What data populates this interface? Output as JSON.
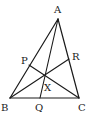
{
  "diagram": {
    "type": "triangle-cevians",
    "vertices": [
      "A",
      "B",
      "C"
    ],
    "points": [
      "P",
      "Q",
      "R",
      "X"
    ],
    "labels": {
      "A": "A",
      "B": "B",
      "C": "C",
      "P": "P",
      "Q": "Q",
      "R": "R",
      "X": "X"
    },
    "segments": [
      {
        "from": "A",
        "to": "B",
        "label": "side-AB"
      },
      {
        "from": "B",
        "to": "C",
        "label": "side-BC"
      },
      {
        "from": "C",
        "to": "A",
        "label": "side-CA"
      },
      {
        "from": "A",
        "to": "Q",
        "label": "cevian-AQ"
      },
      {
        "from": "B",
        "to": "R",
        "label": "cevian-BR"
      },
      {
        "from": "C",
        "to": "P",
        "label": "cevian-CP"
      }
    ],
    "concurrency_point": "X",
    "line_color": "#1a1a1a"
  }
}
